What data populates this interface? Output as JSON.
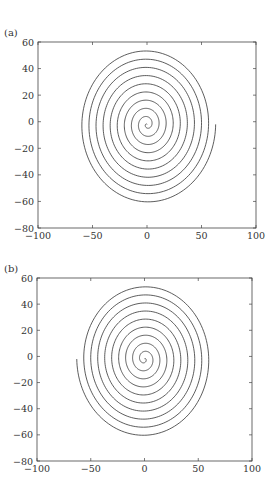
{
  "chart_data": [
    {
      "type": "line",
      "label": "(a)",
      "title": "",
      "xlabel": "",
      "ylabel": "",
      "xlim": [
        -100,
        100
      ],
      "ylim": [
        -80,
        60
      ],
      "xticks": [
        -100,
        -50,
        0,
        50,
        100
      ],
      "yticks": [
        -80,
        -60,
        -40,
        -20,
        0,
        20,
        40,
        60
      ],
      "grid": false,
      "series": [
        {
          "name": "spiral",
          "shape": "archimedean spiral, ~9.5 turns, outer end at (63, 0) on the right",
          "center": [
            0,
            -2
          ],
          "turns": 9.7,
          "r_max": 63,
          "x_scale": 1.0,
          "y_scale": 0.95,
          "direction": 1,
          "end_angle_deg": 0
        }
      ]
    },
    {
      "type": "line",
      "label": "(b)",
      "title": "",
      "xlabel": "",
      "ylabel": "",
      "xlim": [
        -100,
        100
      ],
      "ylim": [
        -80,
        60
      ],
      "xticks": [
        -100,
        -50,
        0,
        50,
        100
      ],
      "yticks": [
        -80,
        -60,
        -40,
        -20,
        0,
        20,
        40,
        60
      ],
      "grid": false,
      "series": [
        {
          "name": "spiral",
          "shape": "archimedean spiral, ~9.5 turns, outer end at (-63, 0) on the left",
          "center": [
            0,
            -2
          ],
          "turns": 9.7,
          "r_max": 63,
          "x_scale": 1.0,
          "y_scale": 0.95,
          "direction": -1,
          "end_angle_deg": 180
        }
      ]
    }
  ]
}
